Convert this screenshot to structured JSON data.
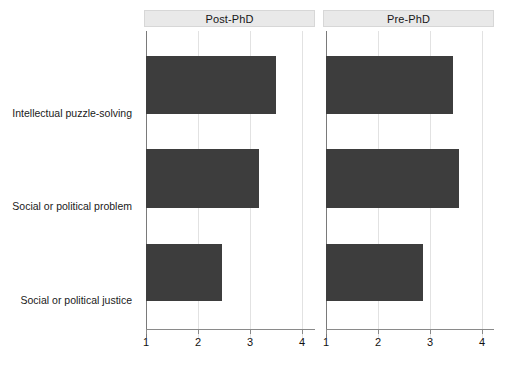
{
  "chart_data": {
    "type": "bar",
    "orientation": "horizontal",
    "title": "",
    "xlabel": "",
    "ylabel": "",
    "categories": [
      "Intellectual puzzle-solving",
      "Social or political problem",
      "Social or political justice"
    ],
    "panels": [
      {
        "label": "Post-PhD",
        "values": [
          3.5,
          3.17,
          2.47
        ]
      },
      {
        "label": "Pre-PhD",
        "values": [
          3.44,
          3.56,
          2.87
        ]
      }
    ],
    "series": [
      {
        "name": "Post-PhD",
        "values": [
          3.5,
          3.17,
          2.47
        ]
      },
      {
        "name": "Pre-PhD",
        "values": [
          3.44,
          3.56,
          2.87
        ]
      }
    ],
    "xlim": [
      1,
      4.23
    ],
    "xticks": [
      1,
      2,
      3,
      4
    ],
    "xticklabels": [
      "1",
      "2",
      "3",
      "4"
    ],
    "grid": true,
    "legend": "none",
    "bar_color": "#3d3d3d",
    "strip_color": "#e9e9e9",
    "gridline_color": "#e2e2e2",
    "axis_color": "#8a8a8a"
  }
}
